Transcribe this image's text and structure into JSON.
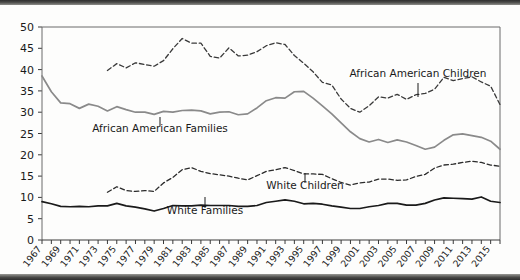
{
  "figure": {
    "name": "poverty-rate-line-chart"
  },
  "chart_data": {
    "type": "line",
    "title": "",
    "subtitle": "",
    "xlabel": "",
    "ylabel": "",
    "grid": false,
    "legend_position": "inline-annotations",
    "xlim": [
      1967,
      2016
    ],
    "ylim": [
      0,
      50
    ],
    "ytick_labels": [
      "0",
      "5",
      "10",
      "15",
      "20",
      "25",
      "30",
      "35",
      "40",
      "45",
      "50"
    ],
    "ytick_values": [
      0,
      5,
      10,
      15,
      20,
      25,
      30,
      35,
      40,
      45,
      50
    ],
    "xtick_labels": [
      "1967",
      "1969",
      "1971",
      "1973",
      "1975",
      "1977",
      "1979",
      "1981",
      "1983",
      "1985",
      "1987",
      "1989",
      "1991",
      "1993",
      "1995",
      "1997",
      "1999",
      "2001",
      "2003",
      "2005",
      "2007",
      "2009",
      "2011",
      "2013",
      "2015"
    ],
    "xtick_values": [
      1967,
      1969,
      1971,
      1973,
      1975,
      1977,
      1979,
      1981,
      1983,
      1985,
      1987,
      1989,
      1991,
      1993,
      1995,
      1997,
      1999,
      2001,
      2003,
      2005,
      2007,
      2009,
      2011,
      2013,
      2015
    ],
    "x": [
      1967,
      1968,
      1969,
      1970,
      1971,
      1972,
      1973,
      1974,
      1975,
      1976,
      1977,
      1978,
      1979,
      1980,
      1981,
      1982,
      1983,
      1984,
      1985,
      1986,
      1987,
      1988,
      1989,
      1990,
      1991,
      1992,
      1993,
      1994,
      1995,
      1996,
      1997,
      1998,
      1999,
      2000,
      2001,
      2002,
      2003,
      2004,
      2005,
      2006,
      2007,
      2008,
      2009,
      2010,
      2011,
      2012,
      2013,
      2014,
      2015,
      2016
    ],
    "series": [
      {
        "name": "African American Children",
        "style": "dashed",
        "color": "#3a3a3a",
        "x_start": 1974,
        "values": [
          null,
          null,
          null,
          null,
          null,
          null,
          null,
          39.8,
          41.4,
          40.4,
          41.6,
          41.2,
          40.8,
          42.1,
          44.9,
          47.3,
          46.2,
          46.2,
          43.1,
          42.7,
          45.1,
          43.2,
          43.4,
          44.2,
          45.6,
          46.3,
          45.9,
          43.3,
          41.5,
          39.5,
          37.0,
          36.4,
          33.1,
          30.9,
          30.0,
          31.5,
          33.6,
          33.3,
          34.2,
          33.0,
          34.1,
          34.4,
          35.4,
          38.2,
          37.4,
          37.9,
          38.3,
          37.1,
          36.1,
          31.8
        ]
      },
      {
        "name": "African American Families",
        "style": "solid",
        "color": "#8a8a8a",
        "x_start": 1967,
        "values": [
          38.5,
          34.8,
          32.2,
          32.0,
          30.9,
          31.9,
          31.4,
          30.3,
          31.3,
          30.6,
          30.0,
          30.0,
          29.5,
          30.2,
          30.0,
          30.4,
          30.5,
          30.3,
          29.6,
          30.0,
          30.1,
          29.4,
          29.6,
          31.0,
          32.7,
          33.4,
          33.3,
          34.8,
          34.9,
          33.3,
          31.5,
          29.6,
          27.5,
          25.4,
          23.8,
          23.0,
          23.6,
          22.9,
          23.5,
          23.0,
          22.2,
          21.3,
          21.8,
          23.4,
          24.7,
          24.9,
          24.5,
          24.1,
          23.2,
          21.3
        ]
      },
      {
        "name": "White Children",
        "style": "dashed",
        "color": "#2b2b2b",
        "x_start": 1974,
        "values": [
          null,
          null,
          null,
          null,
          null,
          null,
          null,
          11.2,
          12.5,
          11.6,
          11.4,
          11.6,
          11.4,
          13.4,
          14.7,
          16.5,
          17.0,
          16.1,
          15.6,
          15.3,
          15.0,
          14.5,
          14.1,
          15.1,
          16.1,
          16.5,
          17.0,
          16.3,
          15.5,
          15.5,
          15.4,
          14.4,
          13.5,
          12.9,
          13.4,
          13.6,
          14.3,
          14.3,
          14.0,
          14.1,
          14.9,
          15.4,
          16.9,
          17.6,
          17.8,
          18.2,
          18.5,
          18.2,
          17.6,
          17.3
        ]
      },
      {
        "name": "White Families",
        "style": "solid",
        "color": "#1a1a1a",
        "x_start": 1967,
        "values": [
          9.0,
          8.5,
          7.9,
          7.8,
          7.9,
          7.8,
          8.0,
          8.0,
          8.6,
          8.0,
          7.7,
          7.3,
          6.8,
          7.4,
          8.1,
          8.0,
          8.0,
          8.2,
          8.1,
          8.1,
          8.1,
          7.9,
          7.9,
          8.1,
          8.8,
          9.1,
          9.4,
          9.1,
          8.5,
          8.6,
          8.4,
          8.0,
          7.7,
          7.4,
          7.4,
          7.8,
          8.1,
          8.6,
          8.6,
          8.2,
          8.2,
          8.6,
          9.4,
          9.9,
          9.8,
          9.7,
          9.6,
          10.1,
          9.1,
          8.8
        ]
      }
    ],
    "annotations": [
      {
        "label": "African American Families",
        "x_pixel": 160,
        "y_pixel": 127,
        "leader_x": 160,
        "leader_y_top": 112,
        "leader_y_bottom": 121,
        "anchor": "middle"
      },
      {
        "label": "African American Children",
        "x_pixel": 418,
        "y_pixel": 72,
        "leader_x": 418,
        "leader_y_top": 78,
        "leader_y_bottom": 92,
        "anchor": "middle"
      },
      {
        "label": "White Children",
        "x_pixel": 305,
        "y_pixel": 184,
        "leader_x": 305,
        "leader_y_top": 168,
        "leader_y_bottom": 178,
        "anchor": "middle"
      },
      {
        "label": "White Families",
        "x_pixel": 205,
        "y_pixel": 209,
        "leader_x": 205,
        "leader_y_top": 192,
        "leader_y_bottom": 203,
        "anchor": "middle"
      }
    ]
  }
}
